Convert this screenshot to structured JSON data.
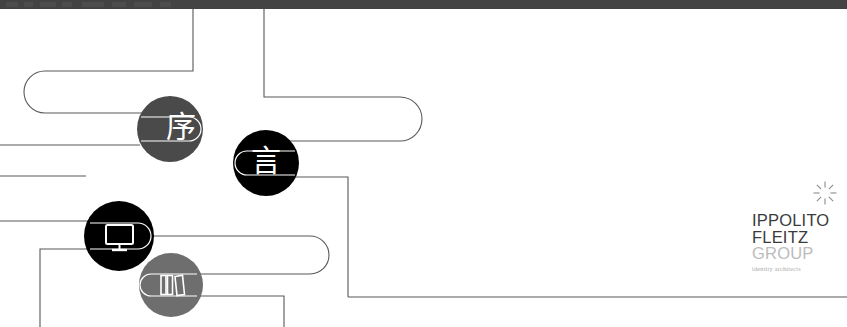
{
  "canvas": {
    "width": 847,
    "height": 327,
    "background": "#ffffff",
    "description": "Cropped screenshot of a white presentation slide showing a routed-line diagram with four circular nodes and the Ippolito Fleitz Group logo"
  },
  "chrome": {
    "present": true,
    "color": "#434343",
    "height": 9,
    "label": "cut-off-toolbar"
  },
  "colors": {
    "line": "#58585a",
    "line_thin": "#6b6b6d",
    "node_dark_gray": "#4a4a4a",
    "node_black": "#000000",
    "node_mid_gray": "#6e6e6e",
    "logo_dark": "#3b3b3b",
    "logo_light": "#bcbcbc",
    "tagline": "#a9a9a9",
    "sparkle": "#8a8a8a",
    "white": "#ffffff"
  },
  "nodes": [
    {
      "id": "node-xu",
      "name": "node-preface",
      "glyph": "序",
      "kind": "text",
      "fill": "#4a4a4a",
      "cx": 170,
      "cy": 129,
      "r": 33
    },
    {
      "id": "node-yan",
      "name": "node-speech",
      "glyph": "言",
      "kind": "text",
      "fill": "#000000",
      "cx": 266,
      "cy": 163,
      "r": 33
    },
    {
      "id": "node-monitor",
      "name": "node-display",
      "glyph": "monitor-icon",
      "kind": "icon",
      "fill": "#000000",
      "cx": 119,
      "cy": 236,
      "r": 35
    },
    {
      "id": "node-books",
      "name": "node-library",
      "glyph": "books-icon",
      "kind": "icon",
      "fill": "#6e6e6e",
      "cx": 171,
      "cy": 285,
      "r": 32
    }
  ],
  "logo": {
    "line1": "IPPOLITO",
    "line2": "FLEITZ",
    "line3": "GROUP",
    "tagline": "identity architects",
    "mark": "sparkle-icon"
  },
  "paths": {
    "note": "Connector routing is layout geometry rendered in SVG",
    "stroke_width": 1.1
  }
}
